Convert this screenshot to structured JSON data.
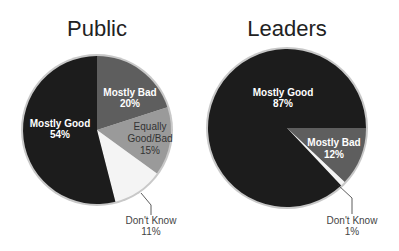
{
  "chart_data": [
    {
      "type": "pie",
      "title": "Public",
      "start_angle_deg": 0,
      "direction": "clockwise",
      "slices": [
        {
          "label": "Mostly Bad",
          "value": 20,
          "display": "20%",
          "color": "#5e5e5e"
        },
        {
          "label": "Equally Good/Bad",
          "value": 15,
          "display": "15%",
          "color": "#9a9a9a"
        },
        {
          "label": "Don't Know",
          "value": 11,
          "display": "11%",
          "color": "#f4f4f4"
        },
        {
          "label": "Mostly Good",
          "value": 54,
          "display": "54%",
          "color": "#1c1c1c"
        }
      ]
    },
    {
      "type": "pie",
      "title": "Leaders",
      "start_angle_deg": 90,
      "direction": "clockwise",
      "slices": [
        {
          "label": "Mostly Bad",
          "value": 12,
          "display": "12%",
          "color": "#5e5e5e"
        },
        {
          "label": "Don't Know",
          "value": 1,
          "display": "1%",
          "color": "#f4f4f4"
        },
        {
          "label": "Mostly Good",
          "value": 87,
          "display": "87%",
          "color": "#1c1c1c"
        }
      ]
    }
  ],
  "labels": {
    "public": {
      "title": "Public",
      "mostly_bad": "Mostly Bad",
      "mostly_bad_pct": "20%",
      "equally_1": "Equally",
      "equally_2": "Good/Bad",
      "equally_pct": "15%",
      "dont_know": "Don't Know",
      "dont_know_pct": "11%",
      "mostly_good": "Mostly Good",
      "mostly_good_pct": "54%"
    },
    "leaders": {
      "title": "Leaders",
      "mostly_good": "Mostly Good",
      "mostly_good_pct": "87%",
      "mostly_bad": "Mostly Bad",
      "mostly_bad_pct": "12%",
      "dont_know": "Don't Know",
      "dont_know_pct": "1%"
    }
  }
}
